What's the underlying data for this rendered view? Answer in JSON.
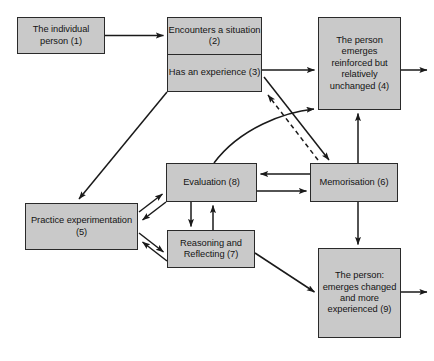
{
  "figure": {
    "type": "flow-diagram",
    "title_visible": false,
    "background_color": "#ffffff",
    "node_fill_color": "#c9c9c9",
    "node_border_color": "#2a2a2a",
    "line_color": "#1a1a1a",
    "text_color": "#141414"
  },
  "nodes": [
    {
      "id": "1",
      "name": "individual-person",
      "label": "The individual person (1)",
      "x": 17,
      "y": 17,
      "w": 88,
      "h": 37
    },
    {
      "id": "2",
      "name": "encounters-situation",
      "label": "Encounters a situation (2)",
      "x": 167,
      "y": 17,
      "w": 95,
      "h": 37
    },
    {
      "id": "3",
      "name": "has-an-experience",
      "label": "Has an experience (3)",
      "x": 167,
      "y": 54,
      "w": 95,
      "h": 38
    },
    {
      "id": "4",
      "name": "emerges-unchanged",
      "label": "The person emerges reinforced but relatively unchanged (4)",
      "x": 318,
      "y": 17,
      "w": 83,
      "h": 93
    },
    {
      "id": "5",
      "name": "practice-experimentation",
      "label": "Practice experimentation (5)",
      "x": 25,
      "y": 203,
      "w": 113,
      "h": 47
    },
    {
      "id": "6",
      "name": "memorisation",
      "label": "Memorisation (6)",
      "x": 310,
      "y": 163,
      "w": 88,
      "h": 39
    },
    {
      "id": "7",
      "name": "reasoning-reflecting",
      "label": "Reasoning and Reflecting (7)",
      "x": 167,
      "y": 230,
      "w": 88,
      "h": 38
    },
    {
      "id": "8",
      "name": "evaluation",
      "label": "Evaluation (8)",
      "x": 166,
      "y": 163,
      "w": 91,
      "h": 39
    },
    {
      "id": "9",
      "name": "emerges-changed",
      "label": "The person: emerges changed and more experienced (9)",
      "x": 318,
      "y": 248,
      "w": 83,
      "h": 90
    }
  ],
  "edges": [
    {
      "name": "edge-1-to-2",
      "from": "1",
      "to": "2",
      "style": "solid",
      "arrow": "single"
    },
    {
      "name": "edge-3-to-4",
      "from": "3",
      "to": "4",
      "style": "solid",
      "arrow": "single"
    },
    {
      "name": "edge-4-exit",
      "from": "4",
      "to": "outside-right",
      "style": "solid",
      "arrow": "single"
    },
    {
      "name": "edge-3-to-5",
      "from": "3",
      "to": "5",
      "style": "solid",
      "arrow": "single"
    },
    {
      "name": "edge-3-to-6",
      "from": "3",
      "to": "6",
      "style": "solid",
      "arrow": "single"
    },
    {
      "name": "edge-6-to-3",
      "from": "6",
      "to": "3",
      "style": "dashed",
      "arrow": "single"
    },
    {
      "name": "edge-8-to-4",
      "from": "8",
      "to": "4",
      "style": "solid",
      "arrow": "single",
      "shape": "curved"
    },
    {
      "name": "edge-6-to-4",
      "from": "6",
      "to": "4",
      "style": "solid",
      "arrow": "single"
    },
    {
      "name": "edge-6-to-8",
      "from": "6",
      "to": "8",
      "style": "solid",
      "arrow": "single"
    },
    {
      "name": "edge-8-to-6",
      "from": "8",
      "to": "6",
      "style": "solid",
      "arrow": "single"
    },
    {
      "name": "edge-6-to-9",
      "from": "6",
      "to": "9",
      "style": "solid",
      "arrow": "single"
    },
    {
      "name": "edge-8-to-7",
      "from": "8",
      "to": "7",
      "style": "solid",
      "arrow": "single"
    },
    {
      "name": "edge-7-to-8",
      "from": "7",
      "to": "8",
      "style": "solid",
      "arrow": "single"
    },
    {
      "name": "edge-5-to-8",
      "from": "5",
      "to": "8",
      "style": "solid",
      "arrow": "single"
    },
    {
      "name": "edge-8-to-5",
      "from": "8",
      "to": "5",
      "style": "solid",
      "arrow": "single"
    },
    {
      "name": "edge-5-to-7",
      "from": "5",
      "to": "7",
      "style": "solid",
      "arrow": "single"
    },
    {
      "name": "edge-7-to-5",
      "from": "7",
      "to": "5",
      "style": "solid",
      "arrow": "single"
    },
    {
      "name": "edge-7-to-9",
      "from": "7",
      "to": "9",
      "style": "solid",
      "arrow": "single"
    },
    {
      "name": "edge-9-exit",
      "from": "9",
      "to": "outside-right",
      "style": "solid",
      "arrow": "single"
    }
  ],
  "caption": {
    "label_number": "",
    "text": "",
    "note": "caption clipped by image bottom edge"
  }
}
